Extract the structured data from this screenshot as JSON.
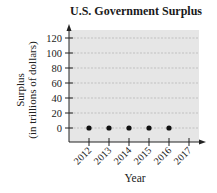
{
  "chart_data": {
    "type": "scatter",
    "title": "U.S. Government Surplus",
    "xlabel": "Year",
    "ylabel": "Surplus (in trillions of dollars)",
    "ylabel_lines": [
      "Surplus",
      "(in trillions of dollars)"
    ],
    "x_ticks": [
      "2012",
      "2013",
      "2014",
      "2015",
      "2016",
      "2017"
    ],
    "y_ticks": [
      0,
      20,
      40,
      60,
      80,
      100,
      120
    ],
    "ylim": [
      -20,
      130
    ],
    "grid": true,
    "legend": null,
    "series": [
      {
        "name": "Surplus",
        "x": [
          2012,
          2013,
          2014,
          2015,
          2016
        ],
        "values": [
          0,
          0,
          0,
          0,
          0
        ]
      }
    ]
  },
  "colors": {
    "plot_background": "#e6e6e6",
    "gridline": "#a8a8a8",
    "axis": "#222222",
    "point": "#111111",
    "text": "#222222"
  }
}
